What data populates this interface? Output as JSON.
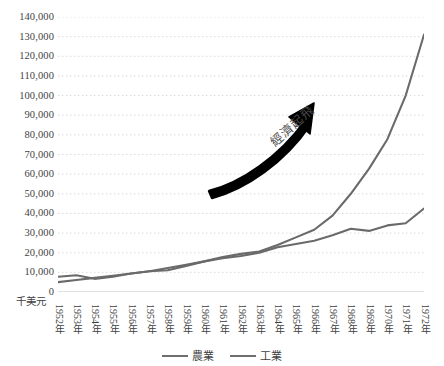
{
  "chart_data": {
    "type": "line",
    "title": "",
    "xlabel": "",
    "ylabel": "千美元",
    "ylim": [
      0,
      140000
    ],
    "ystep": 10000,
    "grid": true,
    "grid_style": "dotted",
    "legend_position": "bottom",
    "categories": [
      "1952年",
      "1953年",
      "1954年",
      "1955年",
      "1956年",
      "1957年",
      "1958年",
      "1959年",
      "1960年",
      "1961年",
      "1962年",
      "1963年",
      "1964年",
      "1965年",
      "1966年",
      "1967年",
      "1968年",
      "1969年",
      "1970年",
      "1971年",
      "1972年"
    ],
    "x": [
      1952,
      1953,
      1954,
      1955,
      1956,
      1957,
      1958,
      1959,
      1960,
      1961,
      1962,
      1963,
      1964,
      1965,
      1966,
      1967,
      1968,
      1969,
      1970,
      1971,
      1972
    ],
    "ytick_labels": [
      "140,000",
      "130,000",
      "120,000",
      "110,000",
      "100,000",
      "90,000",
      "80,000",
      "70,000",
      "60,000",
      "50,000",
      "40,000",
      "30,000",
      "20,000",
      "10,000",
      "0"
    ],
    "ytick_values": [
      140000,
      130000,
      120000,
      110000,
      100000,
      90000,
      80000,
      70000,
      60000,
      50000,
      40000,
      30000,
      20000,
      10000,
      0
    ],
    "series": [
      {
        "name": "農業",
        "color": "#6a6a6a",
        "values": [
          7800,
          8500,
          6700,
          7800,
          9400,
          10600,
          11100,
          13300,
          15600,
          17200,
          18300,
          20000,
          22800,
          24400,
          26100,
          28900,
          32200,
          31100,
          33900,
          35000,
          42500
        ]
      },
      {
        "name": "工業",
        "color": "#6a6a6a",
        "values": [
          5000,
          6100,
          7200,
          8300,
          9400,
          10600,
          12200,
          13900,
          15600,
          17800,
          19400,
          20600,
          23900,
          27800,
          31700,
          38900,
          50000,
          62800,
          77800,
          100000,
          131000
        ]
      }
    ],
    "annotations": [
      {
        "text": "經濟起飛",
        "type": "arrow-label",
        "rotation_deg": -41,
        "arrow_color": "#000000"
      }
    ]
  },
  "legend": {
    "entries": [
      {
        "label": "農業"
      },
      {
        "label": "工業"
      }
    ]
  },
  "axis": {
    "unit_caption": "千美元"
  }
}
